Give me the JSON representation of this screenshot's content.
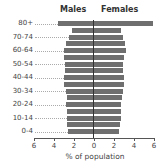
{
  "chart_data": {
    "type": "bar",
    "orientation": "horizontal-pyramid",
    "title": "",
    "xlabel": "% of population",
    "ylabel": "",
    "xlim": [
      -6,
      6
    ],
    "x_ticks": [
      "6",
      "4",
      "2",
      "0",
      "2",
      "4",
      "6"
    ],
    "legend": [
      "Males",
      "Females"
    ],
    "categories": [
      "80+",
      "75-79",
      "70-74",
      "65-69",
      "60-64",
      "55-59",
      "50-54",
      "45-49",
      "40-44",
      "35-39",
      "30-34",
      "25-29",
      "20-24",
      "15-19",
      "10-14",
      "5-9",
      "0-4"
    ],
    "visible_category_labels": [
      "80+",
      "70-74",
      "60-64",
      "50-54",
      "40-44",
      "30-34",
      "20-24",
      "10-14",
      "0-4"
    ],
    "series": [
      {
        "name": "Males",
        "values": [
          3.6,
          2.2,
          2.5,
          2.8,
          3.0,
          3.0,
          2.9,
          2.9,
          3.0,
          3.0,
          2.8,
          2.7,
          2.8,
          2.7,
          2.7,
          2.7,
          2.6
        ]
      },
      {
        "name": "Females",
        "values": [
          5.9,
          2.7,
          2.9,
          3.1,
          3.2,
          3.0,
          2.9,
          2.9,
          3.0,
          3.0,
          2.9,
          2.8,
          2.7,
          2.7,
          2.7,
          2.6,
          2.5
        ]
      }
    ],
    "colors": {
      "bar": "#6f6f6f",
      "center_line": "#333333"
    },
    "grid": false
  },
  "legend": {
    "males": "Males",
    "females": "Females"
  },
  "axis": {
    "xlabel": "% of population",
    "ticks": [
      "6",
      "4",
      "2",
      "0",
      "2",
      "4",
      "6"
    ]
  }
}
